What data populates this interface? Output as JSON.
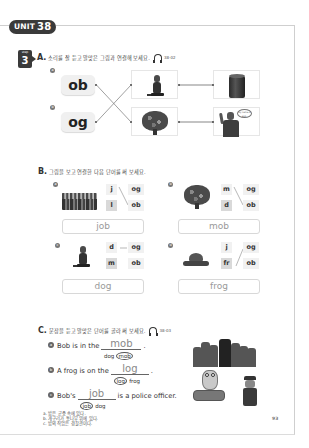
{
  "header": {
    "unit_label": "UNIT",
    "unit_number": "38",
    "step_label": "step",
    "step_number": "3"
  },
  "colors": {
    "badge": "#3a3a3a",
    "tile_light": "#f1f1f1",
    "tile_dark": "#d9d9d9",
    "answer_text": "#999999"
  },
  "section_a": {
    "letter": "A.",
    "instruction": "소리를 잘 듣고 알맞은 그림과 연결해 보세요.",
    "track": "38-02",
    "icon": "headphones-icon",
    "items": [
      {
        "marker": "a",
        "syllable": "ob"
      },
      {
        "marker": "b",
        "syllable": "og"
      }
    ],
    "pictures": [
      {
        "name": "dog",
        "icon": "dog-image"
      },
      {
        "name": "log",
        "icon": "log-image"
      },
      {
        "name": "mob",
        "icon": "tree-crowd-image"
      },
      {
        "name": "bob",
        "icon": "man-waving-image",
        "speech": "My name is Bob."
      }
    ],
    "connections": [
      {
        "from": "ob",
        "to": "mob"
      },
      {
        "from": "og",
        "to": "dog"
      },
      {
        "from": "dog",
        "to": "log"
      },
      {
        "from": "mob",
        "to": "bob"
      }
    ]
  },
  "section_b": {
    "letter": "B.",
    "instruction": "그림을 보고 연결한 다음 단어를 써 보세요.",
    "items": [
      {
        "marker": "a",
        "image": "crowd-image",
        "onsets": [
          "j",
          "l"
        ],
        "rimes": [
          "og",
          "ob"
        ],
        "answer": "job"
      },
      {
        "marker": "b",
        "image": "mob-image",
        "onsets": [
          "m",
          "d"
        ],
        "rimes": [
          "og",
          "ob"
        ],
        "answer": "mob"
      },
      {
        "marker": "c",
        "image": "dog-image",
        "onsets": [
          "d",
          "m"
        ],
        "rimes": [
          "og",
          "ob"
        ],
        "answer": "dog"
      },
      {
        "marker": "d",
        "image": "frog-image",
        "onsets": [
          "j",
          "fr"
        ],
        "rimes": [
          "og",
          "ob"
        ],
        "answer": "frog"
      }
    ]
  },
  "section_c": {
    "letter": "C.",
    "instruction": "문장을 듣고 알맞은 단어를 골라 써 보세요.",
    "track": "38-03",
    "items": [
      {
        "marker": "a",
        "before": "Bob is in the",
        "answer": "mob",
        "after": ".",
        "choice1": "dog",
        "choice2": "mob",
        "selected": "mob"
      },
      {
        "marker": "b",
        "before": "A frog is on the",
        "answer": "log",
        "after": ".",
        "choice1": "log",
        "choice2": "frog",
        "selected": "log"
      },
      {
        "marker": "c",
        "before": "Bob's",
        "answer": "job",
        "after": "is a police officer.",
        "choice1": "job",
        "choice2": "dog",
        "selected": "job"
      }
    ],
    "translations": [
      "a. 밥은 군중 속에 있다.",
      "b. 개구리가 통나무 위에 있다.",
      "c. 밥의 직업은 경찰관이다."
    ]
  },
  "footer": {
    "page_number": "93"
  }
}
